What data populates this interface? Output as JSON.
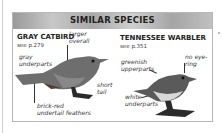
{
  "header": {
    "title": "SIMILAR SPECIES"
  },
  "species": [
    {
      "name": "GRAY CATBIRD",
      "ref": "see p.279",
      "labels": [
        "larger",
        "overall",
        "gray",
        "underparts",
        "short",
        "tail",
        "brick-red",
        "undertail feathers"
      ]
    },
    {
      "name": "TENNESSEE WARBLER",
      "ref": "see p.351",
      "labels": [
        "no eye-",
        "ring",
        "greenish",
        "upperparts",
        "white",
        "underparts"
      ]
    }
  ],
  "colors": {
    "header_bg": "#b0b0b0",
    "border": "#b8b8b8",
    "text": "#222222"
  }
}
